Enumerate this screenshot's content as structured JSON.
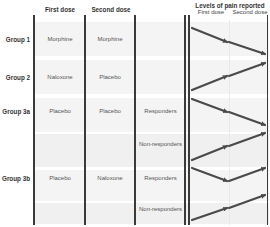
{
  "headers": {
    "first_dose": "First dose",
    "second_dose": "Second dose",
    "levels": "Levels of pain reported",
    "levels_first": "First dose",
    "levels_second": "Second dose"
  },
  "groups": [
    {
      "label": "Group 1",
      "first": "Morphine",
      "second": "Morphine"
    },
    {
      "label": "Group 2",
      "first": "Naloxone",
      "second": "Placebo"
    },
    {
      "label": "Group 3a",
      "first": "Placebo",
      "second": "Placebo"
    },
    {
      "label": "Group 3b",
      "first": "Placebo",
      "second": "Naloxone"
    }
  ],
  "responses": [
    {
      "label": "Responders"
    },
    {
      "label": "Non-responders"
    },
    {
      "label": "Responders"
    },
    {
      "label": "Non-responders"
    }
  ],
  "pain_trends": [
    {
      "row": "Group 1",
      "trend": "down-down"
    },
    {
      "row": "Group 2",
      "trend": "up-up"
    },
    {
      "row": "Group 3a Responders",
      "trend": "down-down"
    },
    {
      "row": "Group 3a Non-responders",
      "trend": "up-up"
    },
    {
      "row": "Group 3b Responders",
      "trend": "down-up"
    },
    {
      "row": "Group 3b Non-responders",
      "trend": "up-up"
    }
  ],
  "colors": {
    "line": "#3a3a3a",
    "arrow": "#4a4a4a",
    "band": "#f3f3f3"
  }
}
